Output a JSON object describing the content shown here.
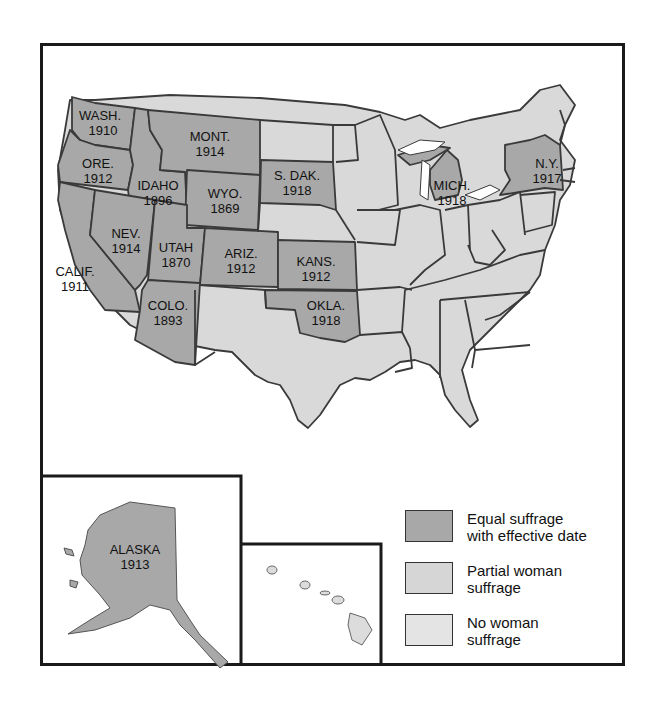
{
  "map": {
    "colors": {
      "equal": "#a8a8a8",
      "partial": "#d6d6d6",
      "none": "#e2e2e2",
      "border": "#3a3a3a",
      "frame": "#1a1a1a"
    },
    "equal_suffrage_states": [
      {
        "abbr": "WASH.",
        "year": "1910"
      },
      {
        "abbr": "ORE.",
        "year": "1912"
      },
      {
        "abbr": "CALIF.",
        "year": "1911"
      },
      {
        "abbr": "IDAHO",
        "year": "1896"
      },
      {
        "abbr": "NEV.",
        "year": "1914"
      },
      {
        "abbr": "MONT.",
        "year": "1914"
      },
      {
        "abbr": "WYO.",
        "year": "1869"
      },
      {
        "abbr": "UTAH",
        "year": "1870"
      },
      {
        "abbr": "ARIZ.",
        "year": "1912"
      },
      {
        "abbr": "COLO.",
        "year": "1893"
      },
      {
        "abbr": "S. DAK.",
        "year": "1918"
      },
      {
        "abbr": "KANS.",
        "year": "1912"
      },
      {
        "abbr": "OKLA.",
        "year": "1918"
      },
      {
        "abbr": "MICH.",
        "year": "1918"
      },
      {
        "abbr": "N.Y.",
        "year": "1917"
      },
      {
        "abbr": "ALASKA",
        "year": "1913"
      }
    ],
    "legend": [
      {
        "key": "equal",
        "label": "Equal suffrage\nwith effective date"
      },
      {
        "key": "partial",
        "label": "Partial woman\nsuffrage"
      },
      {
        "key": "none",
        "label": "No woman\nsuffrage"
      }
    ]
  }
}
